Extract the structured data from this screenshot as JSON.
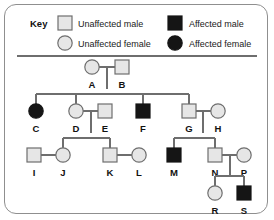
{
  "figure": {
    "type": "pedigree-chart",
    "key_title": "Key",
    "frame_color": "#8f8f8f",
    "unaffected_fill": "#e6e6e6",
    "affected_fill": "#151515",
    "line_color": "#6e6e6e"
  },
  "legend": {
    "items": [
      {
        "label": "Unaffected male",
        "shape": "square",
        "state": "unaffected",
        "icon": "square-unaffected-icon"
      },
      {
        "label": "Affected male",
        "shape": "square",
        "state": "affected",
        "icon": "square-affected-icon"
      },
      {
        "label": "Unaffected female",
        "shape": "circle",
        "state": "unaffected",
        "icon": "circle-unaffected-icon"
      },
      {
        "label": "Affected female",
        "shape": "circle",
        "state": "affected",
        "icon": "circle-affected-icon"
      }
    ]
  },
  "generations": [
    {
      "number": 1,
      "individuals": [
        {
          "id": "A",
          "sex": "female",
          "state": "unaffected",
          "x": 92,
          "y": 67
        },
        {
          "id": "B",
          "sex": "male",
          "state": "unaffected",
          "x": 122,
          "y": 67
        }
      ]
    },
    {
      "number": 2,
      "individuals": [
        {
          "id": "C",
          "sex": "female",
          "state": "affected",
          "x": 36,
          "y": 111
        },
        {
          "id": "D",
          "sex": "female",
          "state": "unaffected",
          "x": 76,
          "y": 111
        },
        {
          "id": "E",
          "sex": "male",
          "state": "unaffected",
          "x": 105,
          "y": 111
        },
        {
          "id": "F",
          "sex": "male",
          "state": "affected",
          "x": 143,
          "y": 111
        },
        {
          "id": "G",
          "sex": "male",
          "state": "unaffected",
          "x": 189,
          "y": 111
        },
        {
          "id": "H",
          "sex": "female",
          "state": "unaffected",
          "x": 218,
          "y": 111
        }
      ]
    },
    {
      "number": 3,
      "individuals": [
        {
          "id": "I",
          "sex": "male",
          "state": "unaffected",
          "x": 34,
          "y": 155
        },
        {
          "id": "J",
          "sex": "female",
          "state": "unaffected",
          "x": 63,
          "y": 155
        },
        {
          "id": "K",
          "sex": "male",
          "state": "unaffected",
          "x": 110,
          "y": 155
        },
        {
          "id": "L",
          "sex": "female",
          "state": "unaffected",
          "x": 139,
          "y": 155
        },
        {
          "id": "M",
          "sex": "male",
          "state": "affected",
          "x": 174,
          "y": 155
        },
        {
          "id": "N",
          "sex": "male",
          "state": "unaffected",
          "x": 215,
          "y": 155
        },
        {
          "id": "P",
          "sex": "female",
          "state": "unaffected",
          "x": 244,
          "y": 155
        }
      ]
    },
    {
      "number": 4,
      "individuals": [
        {
          "id": "R",
          "sex": "female",
          "state": "unaffected",
          "x": 215,
          "y": 193
        },
        {
          "id": "S",
          "sex": "male",
          "state": "affected",
          "x": 244,
          "y": 193
        }
      ]
    }
  ],
  "matings": [
    {
      "partners": [
        "A",
        "B"
      ],
      "children": [
        "C",
        "D",
        "F",
        "G"
      ]
    },
    {
      "partners": [
        "D",
        "E"
      ],
      "children": [
        "J",
        "K"
      ]
    },
    {
      "partners": [
        "G",
        "H"
      ],
      "children": [
        "M",
        "N"
      ]
    },
    {
      "partners": [
        "I",
        "J"
      ],
      "children": []
    },
    {
      "partners": [
        "K",
        "L"
      ],
      "children": []
    },
    {
      "partners": [
        "N",
        "P"
      ],
      "children": [
        "R",
        "S"
      ]
    }
  ]
}
